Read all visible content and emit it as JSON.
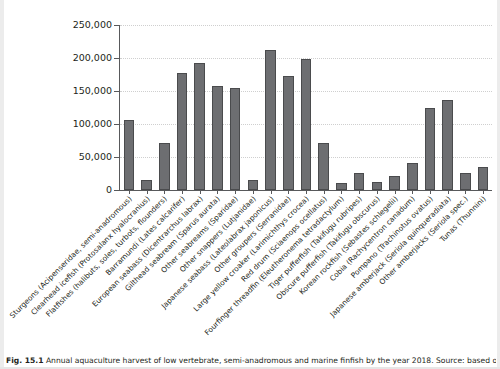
{
  "chart_data": {
    "type": "bar",
    "title": "",
    "xlabel": "",
    "ylabel": "Aquaculture harvest [tons]",
    "ylim": [
      0,
      250000
    ],
    "ytick_labels": [
      "250,000",
      "200,000",
      "150,000",
      "100,000",
      "50,000",
      "0"
    ],
    "ytick_values": [
      250000,
      200000,
      150000,
      100000,
      50000,
      0
    ],
    "grid": "horizontal-dotted",
    "legend": "none",
    "bar_color": "#6d6e71",
    "categories": [
      "Sturgeons (Acipenseridae, semi-anadromous)",
      "Clearhead icefish (Protosalanx hyalocranius)",
      "Flatfishes (halibuts, soles, turbots, flounders)",
      "Barramundi (Lates calcarifer)",
      "European seabass (Dicentrarchus labrax)",
      "Gilthead seabream (Sparus aurata)",
      "Other seabreams (Sparidae)",
      "Other snappers (Lutjanidae)",
      "Japanese seabass (Lateolabrax japonicus)",
      "Other groupers (Serranidae)",
      "Large yellow croaker (Larimichthys crocea)",
      "Red drum (Sciaenops ocellatus)",
      "Fourfinger threadfin (Eleutheronema tetradactylum)",
      "Tiger pufferfish (Takifugu rubripes)",
      "Obscure pufferfish (Takifugu obscurus)",
      "Korean rockfish (Sebastes schlegelii)",
      "Cobia (Rachycentron canadum)",
      "Pompano (Trachinotus ovatus)",
      "Japanese amberjack (Seriola quinqueradiata)",
      "Other amberjacks (Seriola spec.)",
      "Tunas (Thunnini)"
    ],
    "values": [
      106000,
      15500,
      71000,
      177000,
      193000,
      158000,
      155000,
      15000,
      212000,
      173000,
      198000,
      70500,
      11000,
      26000,
      11500,
      21000,
      40500,
      124000,
      137000,
      25500,
      35500
    ]
  },
  "caption": {
    "label": "Fig. 15.1",
    "text": "Annual aquaculture harvest of low vertebrate, semi-anadromous and marine finfish by the year 2018. Source: based on"
  }
}
